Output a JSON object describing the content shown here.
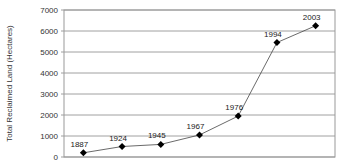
{
  "chart_data": {
    "type": "line",
    "title": "",
    "xlabel": "",
    "ylabel": "Total Reclaimed Land (Hectares)",
    "ylim": [
      0,
      7000
    ],
    "yticks": [
      0,
      1000,
      2000,
      3000,
      4000,
      5000,
      6000,
      7000
    ],
    "grid": true,
    "legend": "none",
    "categories": [
      "1887",
      "1924",
      "1945",
      "1967",
      "1976",
      "1994",
      "2003"
    ],
    "series": [
      {
        "name": "Total Reclaimed Land",
        "values": [
          200,
          500,
          600,
          1050,
          1950,
          5450,
          6250
        ],
        "color": "#000000",
        "marker": "diamond"
      }
    ],
    "data_labels": [
      "1887",
      "1924",
      "1945",
      "1967",
      "1976",
      "1994",
      "2003"
    ]
  }
}
